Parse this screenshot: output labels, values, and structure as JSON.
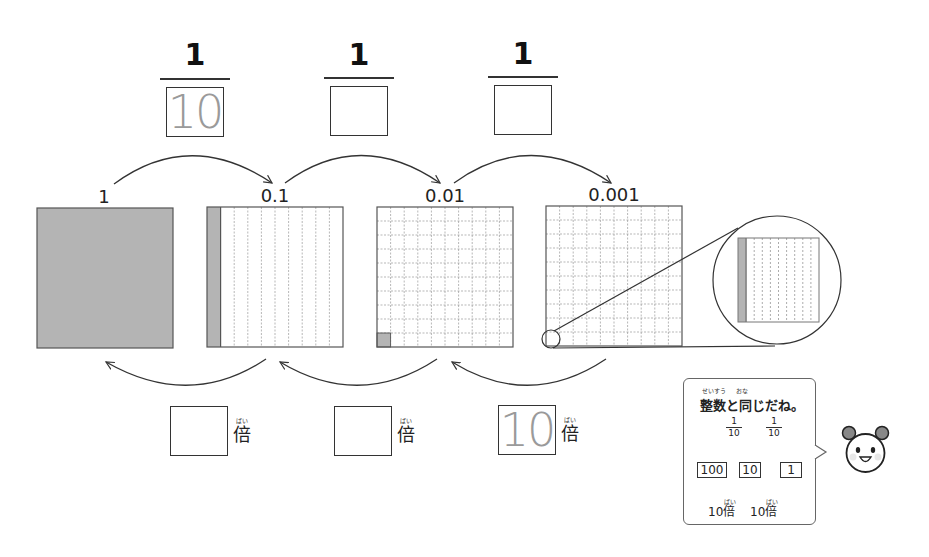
{
  "fractions": [
    {
      "numerator": "1",
      "denominator_answer": "10"
    },
    {
      "numerator": "1",
      "denominator_answer": ""
    },
    {
      "numerator": "1",
      "denominator_answer": ""
    }
  ],
  "values": [
    "1",
    "0.1",
    "0.01",
    "0.001"
  ],
  "multipliers": [
    {
      "answer": "",
      "suffix": "倍",
      "furigana": "ばい"
    },
    {
      "answer": "",
      "suffix": "倍",
      "furigana": "ばい"
    },
    {
      "answer": "10",
      "suffix": "倍",
      "furigana": "ばい"
    }
  ],
  "bubble": {
    "title": "整数と同じだね。",
    "title_furigana_1": "せいすう",
    "title_furigana_2": "おな",
    "fraction_num": "1",
    "fraction_den": "10",
    "boxes": [
      "100",
      "10",
      "1"
    ],
    "times_label": "10倍",
    "times_furigana": "ばい"
  },
  "colors": {
    "shade": "#b4b4b4",
    "line": "#333333",
    "grid": "#999999",
    "answer": "#9a9a9a"
  }
}
